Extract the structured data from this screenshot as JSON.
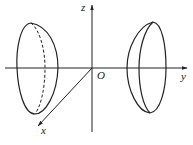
{
  "diagram": {
    "axes": {
      "z": {
        "label": "z"
      },
      "y": {
        "label": "y"
      },
      "x": {
        "label": "x"
      },
      "origin": {
        "label": "O"
      }
    },
    "shapes": [
      {
        "name": "left-solid",
        "position": "negative y side",
        "hidden_edge": "dashed"
      },
      {
        "name": "right-solid",
        "position": "positive y side",
        "hidden_edge": "none"
      }
    ],
    "colors": {
      "stroke": "#222222",
      "background": "#ffffff"
    }
  }
}
